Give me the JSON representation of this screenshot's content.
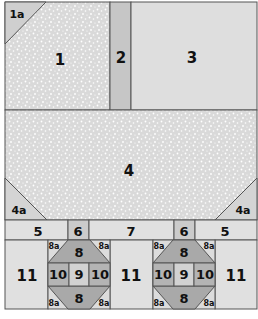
{
  "colors": {
    "light": "#e2e2e2",
    "medium": "#c4c4c4",
    "dark": "#a9a9a9",
    "speckle": "#dcdcdc",
    "line": "#555555"
  },
  "labels": {
    "p1a": "1a",
    "p1": "1",
    "p2": "2",
    "p3": "3",
    "p4": "4",
    "p4a_left": "4a",
    "p4a_right": "4a",
    "p5_left": "5",
    "p6_left": "6",
    "p7": "7",
    "p6_right": "6",
    "p5_right": "5",
    "p11_left": "11",
    "p11_mid": "11",
    "p11_right": "11",
    "p8": "8",
    "p8a": "8a",
    "p9": "9",
    "p10": "10"
  }
}
